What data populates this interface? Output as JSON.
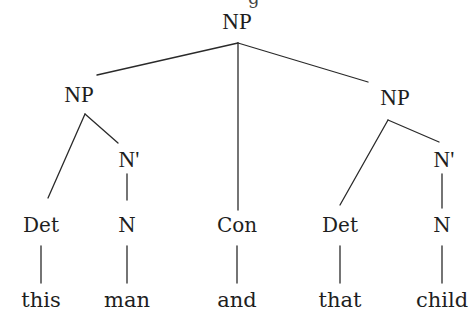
{
  "diagram": {
    "type": "syntax-tree",
    "cropped_top_text": "g",
    "nodes": {
      "root": {
        "label": "NP",
        "x": 237,
        "y": 13
      },
      "np_left": {
        "label": "NP",
        "x": 79,
        "y": 86
      },
      "np_right": {
        "label": "NP",
        "x": 395,
        "y": 89
      },
      "nbar_left": {
        "label": "N'",
        "x": 129,
        "y": 151
      },
      "nbar_right": {
        "label": "N'",
        "x": 444,
        "y": 151
      },
      "det_left": {
        "label": "Det",
        "x": 41,
        "y": 218
      },
      "n_left": {
        "label": "N",
        "x": 127,
        "y": 218
      },
      "con": {
        "label": "Con",
        "x": 237,
        "y": 218
      },
      "det_right": {
        "label": "Det",
        "x": 340,
        "y": 218
      },
      "n_right": {
        "label": "N",
        "x": 442,
        "y": 218
      },
      "leaf_this": {
        "label": "this",
        "x": 41,
        "y": 293
      },
      "leaf_man": {
        "label": "man",
        "x": 127,
        "y": 293
      },
      "leaf_and": {
        "label": "and",
        "x": 237,
        "y": 293
      },
      "leaf_that": {
        "label": "that",
        "x": 340,
        "y": 293
      },
      "leaf_child": {
        "label": "child",
        "x": 442,
        "y": 293
      }
    },
    "edges": [
      {
        "from": "root",
        "to": "np_left",
        "x1": 238,
        "y1": 43,
        "x2": 97,
        "y2": 75
      },
      {
        "from": "root",
        "to": "con",
        "x1": 238,
        "y1": 43,
        "x2": 238,
        "y2": 210
      },
      {
        "from": "root",
        "to": "np_right",
        "x1": 238,
        "y1": 43,
        "x2": 368,
        "y2": 82
      },
      {
        "from": "np_left",
        "to": "det_left",
        "x1": 85,
        "y1": 114,
        "x2": 48,
        "y2": 198
      },
      {
        "from": "np_left",
        "to": "nbar_left",
        "x1": 85,
        "y1": 114,
        "x2": 118,
        "y2": 143
      },
      {
        "from": "nbar_left",
        "to": "n_left",
        "x1": 127,
        "y1": 174,
        "x2": 127,
        "y2": 200
      },
      {
        "from": "np_right",
        "to": "det_right",
        "x1": 388,
        "y1": 120,
        "x2": 340,
        "y2": 205
      },
      {
        "from": "np_right",
        "to": "nbar_right",
        "x1": 388,
        "y1": 120,
        "x2": 439,
        "y2": 142
      },
      {
        "from": "nbar_right",
        "to": "n_right",
        "x1": 442,
        "y1": 174,
        "x2": 442,
        "y2": 208
      },
      {
        "from": "det_left",
        "to": "leaf_this",
        "x1": 41,
        "y1": 246,
        "x2": 41,
        "y2": 283
      },
      {
        "from": "n_left",
        "to": "leaf_man",
        "x1": 127,
        "y1": 246,
        "x2": 127,
        "y2": 283
      },
      {
        "from": "con",
        "to": "leaf_and",
        "x1": 237,
        "y1": 246,
        "x2": 237,
        "y2": 283
      },
      {
        "from": "det_right",
        "to": "leaf_that",
        "x1": 340,
        "y1": 246,
        "x2": 340,
        "y2": 283
      },
      {
        "from": "n_right",
        "to": "leaf_child",
        "x1": 442,
        "y1": 246,
        "x2": 442,
        "y2": 283
      }
    ],
    "sentence": "this man and that child",
    "colors": {
      "line": "#2a2a2a",
      "text": "#1e1e1e",
      "background": "#ffffff"
    }
  }
}
